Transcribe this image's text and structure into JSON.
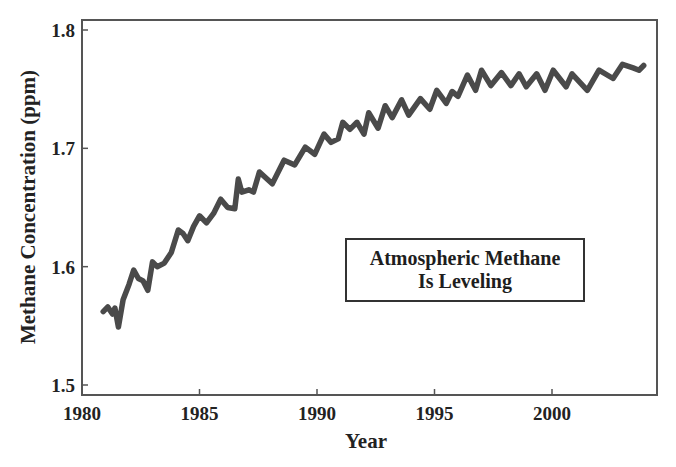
{
  "chart_data": {
    "type": "line",
    "title": "",
    "xlabel": "Year",
    "ylabel": "Methane Concentration (ppm)",
    "xlim": [
      1980,
      2004.8
    ],
    "ylim": [
      1.49,
      1.81
    ],
    "x_ticks": [
      1980,
      1985,
      1990,
      1995,
      2000
    ],
    "x_tick_labels": [
      "1980",
      "1985",
      "1990",
      "1995",
      "2000"
    ],
    "y_ticks": [
      1.5,
      1.6,
      1.7,
      1.8
    ],
    "y_tick_labels": [
      "1.5",
      "1.6",
      "1.7",
      "1.8"
    ],
    "grid": false,
    "legend": null,
    "annotations": [
      {
        "text_lines": [
          "Atmospheric Methane",
          "Is Leveling"
        ],
        "position": "center-right box"
      }
    ],
    "series": [
      {
        "name": "Atmospheric methane",
        "color": "#4a4a4a",
        "x": [
          1980.9,
          1981.1,
          1981.3,
          1981.4,
          1981.55,
          1981.75,
          1982.0,
          1982.2,
          1982.4,
          1982.6,
          1982.8,
          1983.0,
          1983.2,
          1983.5,
          1983.8,
          1984.1,
          1984.3,
          1984.5,
          1984.75,
          1985.0,
          1985.3,
          1985.6,
          1985.9,
          1986.2,
          1986.5,
          1986.65,
          1986.8,
          1987.1,
          1987.3,
          1987.55,
          1988.1,
          1988.6,
          1989.05,
          1989.5,
          1989.9,
          1990.3,
          1990.6,
          1990.9,
          1991.1,
          1991.4,
          1991.7,
          1992.0,
          1992.2,
          1992.6,
          1992.9,
          1993.2,
          1993.6,
          1993.9,
          1994.4,
          1994.8,
          1995.1,
          1995.5,
          1995.75,
          1996.0,
          1996.4,
          1996.75,
          1997.0,
          1997.4,
          1997.85,
          1998.25,
          1998.6,
          1998.9,
          1999.35,
          1999.7,
          2000.05,
          2000.6,
          2000.85,
          2001.5,
          2002.0,
          2002.6,
          2003.0,
          2003.45,
          2003.7,
          2003.9
        ],
        "y": [
          1.562,
          1.566,
          1.56,
          1.565,
          1.549,
          1.572,
          1.585,
          1.597,
          1.59,
          1.588,
          1.58,
          1.604,
          1.6,
          1.603,
          1.612,
          1.631,
          1.628,
          1.622,
          1.634,
          1.643,
          1.637,
          1.645,
          1.657,
          1.65,
          1.649,
          1.674,
          1.663,
          1.665,
          1.663,
          1.68,
          1.67,
          1.69,
          1.686,
          1.701,
          1.695,
          1.712,
          1.705,
          1.708,
          1.722,
          1.716,
          1.722,
          1.712,
          1.73,
          1.717,
          1.736,
          1.726,
          1.741,
          1.728,
          1.742,
          1.733,
          1.749,
          1.738,
          1.748,
          1.744,
          1.762,
          1.749,
          1.766,
          1.753,
          1.764,
          1.753,
          1.763,
          1.752,
          1.763,
          1.749,
          1.766,
          1.752,
          1.763,
          1.749,
          1.766,
          1.759,
          1.771,
          1.768,
          1.766,
          1.77
        ]
      }
    ]
  },
  "labels": {
    "xlabel": "Year",
    "ylabel": "Methane Concentration (ppm)",
    "annotation_line1": "Atmospheric Methane",
    "annotation_line2": "Is Leveling"
  }
}
